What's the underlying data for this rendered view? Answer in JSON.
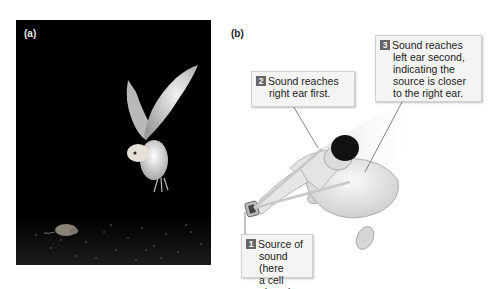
{
  "panels": [
    {
      "id": "a",
      "label": "(a)",
      "description": "Barn owl in flight at night descending toward a mouse on the ground"
    },
    {
      "id": "b",
      "label": "(b)",
      "description": "Overhead view of a person holding a cell phone; sound lines reach right ear then left ear"
    }
  ],
  "callouts": [
    {
      "number": "1",
      "lines": [
        "Source of",
        "sound (here",
        "a cell phone)"
      ]
    },
    {
      "number": "2",
      "lines": [
        "Sound reaches",
        "right ear first."
      ]
    },
    {
      "number": "3",
      "lines": [
        "Sound reaches",
        "left ear second,",
        "indicating the",
        "source is closer",
        "to the right ear."
      ]
    }
  ],
  "colors": {
    "badge": "#666666",
    "callout_bg": "#f4f4f4",
    "photo_bg": "#000000"
  }
}
